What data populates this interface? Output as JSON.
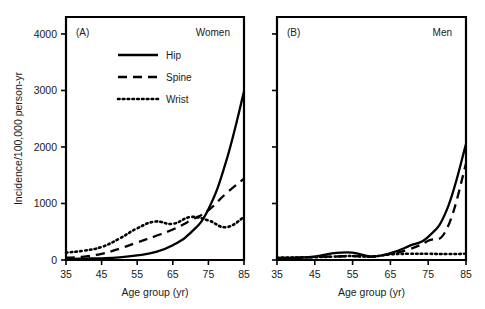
{
  "figure": {
    "width": 485,
    "height": 309,
    "background": "#ffffff",
    "ink_color": "#000000"
  },
  "axis_titles": {
    "y": "Incidence/100,000 person-yr",
    "x": "Age group (yr)"
  },
  "legend": {
    "position": "inside-top-left-of-panel-A",
    "entries": [
      {
        "label": "Hip",
        "style": "solid",
        "sample": "hip-line-sample"
      },
      {
        "label": "Spine",
        "style": "dashed",
        "sample": "spine-line-sample"
      },
      {
        "label": "Wrist",
        "style": "dotted",
        "sample": "wrist-line-sample"
      }
    ]
  },
  "chart_data": {
    "type": "line",
    "title": "",
    "xlabel": "Age group (yr)",
    "ylabel": "Incidence/100,000 person-yr",
    "xlim": [
      35,
      85
    ],
    "ylim": [
      0,
      4300
    ],
    "xticks": [
      35,
      45,
      55,
      65,
      75,
      85
    ],
    "yticks": [
      0,
      1000,
      2000,
      3000,
      4000
    ],
    "grid": false,
    "panels": [
      {
        "tag": "(A)",
        "title": "Women",
        "x": [
          35,
          40,
          45,
          50,
          55,
          60,
          65,
          70,
          75,
          80,
          85
        ],
        "series": [
          {
            "name": "Hip",
            "style": "solid",
            "values": [
              20,
              25,
              30,
              45,
              80,
              140,
              260,
              480,
              900,
              1750,
              2980
            ]
          },
          {
            "name": "Spine",
            "style": "dashed",
            "values": [
              40,
              60,
              110,
              200,
              310,
              420,
              540,
              700,
              880,
              1180,
              1440
            ]
          },
          {
            "name": "Wrist",
            "style": "dotted",
            "values": [
              130,
              165,
              230,
              380,
              560,
              680,
              640,
              760,
              700,
              580,
              760
            ]
          }
        ]
      },
      {
        "tag": "(B)",
        "title": "Men",
        "x": [
          35,
          40,
          45,
          50,
          55,
          60,
          65,
          70,
          75,
          80,
          85
        ],
        "series": [
          {
            "name": "Hip",
            "style": "solid",
            "values": [
              35,
              40,
              60,
              120,
              130,
              60,
              120,
              250,
              410,
              900,
              2050
            ]
          },
          {
            "name": "Spine",
            "style": "dashed",
            "values": [
              30,
              35,
              55,
              60,
              70,
              60,
              110,
              190,
              340,
              560,
              1700
            ]
          },
          {
            "name": "Wrist",
            "style": "dotted",
            "values": [
              40,
              45,
              50,
              60,
              70,
              60,
              100,
              110,
              110,
              105,
              110
            ]
          }
        ]
      }
    ]
  }
}
